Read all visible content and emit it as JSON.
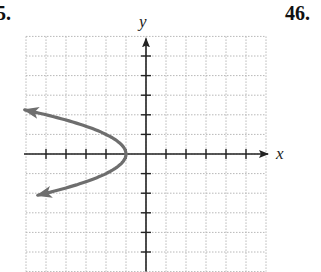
{
  "problems": {
    "left_number": "5.",
    "right_number": "46."
  },
  "chart_data": {
    "type": "line",
    "title": "",
    "xlabel": "x",
    "ylabel": "y",
    "xlim": [
      -6,
      6
    ],
    "ylim": [
      -6,
      6
    ],
    "grid": true,
    "grid_style": "dotted",
    "x_ticks": [
      -5,
      -4,
      -3,
      -2,
      -1,
      1,
      2,
      3,
      4,
      5
    ],
    "y_ticks": [
      -5,
      -4,
      -3,
      -2,
      -1,
      1,
      2,
      3,
      4,
      5
    ],
    "tick_labels_shown": false,
    "series": [
      {
        "name": "parabola x = -y^2 - 1",
        "equation": "x = -y^2 - 1",
        "vertex": [
          -1,
          0
        ],
        "opens": "left",
        "arrows_at_ends": true,
        "color": "#6e6e6e",
        "points": [
          {
            "x": -6,
            "y": 2.25
          },
          {
            "x": -5,
            "y": 2.0
          },
          {
            "x": -3.25,
            "y": 1.5
          },
          {
            "x": -2,
            "y": 1.0
          },
          {
            "x": -1.25,
            "y": 0.5
          },
          {
            "x": -1,
            "y": 0
          },
          {
            "x": -1.25,
            "y": -0.5
          },
          {
            "x": -2,
            "y": -1.0
          },
          {
            "x": -3.25,
            "y": -1.5
          },
          {
            "x": -5,
            "y": -2.0
          },
          {
            "x": -6,
            "y": -2.1
          }
        ]
      }
    ]
  },
  "colors": {
    "axis": "#222222",
    "grid": "#b8b8b8",
    "curve": "#6e6e6e"
  }
}
